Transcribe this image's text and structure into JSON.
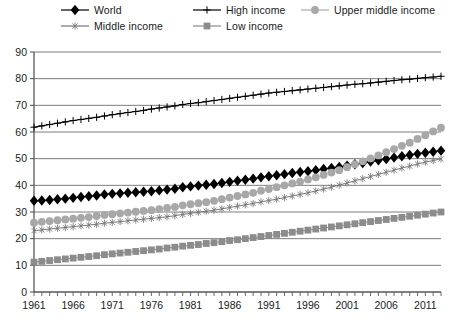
{
  "legend": {
    "items": [
      {
        "label": "World",
        "marker": "diamond-marker",
        "color": "#000000",
        "row": 0,
        "col": 0
      },
      {
        "label": "High income",
        "marker": "plus-marker",
        "color": "#000000",
        "row": 0,
        "col": 1
      },
      {
        "label": "Upper middle income",
        "marker": "circle-marker",
        "color": "#a8a8a8",
        "row": 0,
        "col": 2
      },
      {
        "label": "Middle income",
        "marker": "asterisk-marker",
        "color": "#767676",
        "row": 1,
        "col": 0
      },
      {
        "label": "Low income",
        "marker": "square-marker",
        "color": "#8c8c8c",
        "row": 1,
        "col": 1
      }
    ]
  },
  "chart_data": {
    "type": "line",
    "title": "",
    "xlabel": "",
    "ylabel": "",
    "xlim": [
      1961,
      2013
    ],
    "ylim": [
      0,
      90
    ],
    "ytick_step": 10,
    "yticks": [
      0,
      10,
      20,
      30,
      40,
      50,
      60,
      70,
      80,
      90
    ],
    "xticks": [
      1961,
      1966,
      1971,
      1976,
      1981,
      1986,
      1991,
      1996,
      2001,
      2006,
      2011
    ],
    "xtick_labels": [
      "1961",
      "1966",
      "1971",
      "1976",
      "1981",
      "1986",
      "1991",
      "1996",
      "2001",
      "2006",
      "2011"
    ],
    "minor_xticks_every": 1,
    "grid": "horizontal",
    "legend_position": "top",
    "x": [
      1961,
      1962,
      1963,
      1964,
      1965,
      1966,
      1967,
      1968,
      1969,
      1970,
      1971,
      1972,
      1973,
      1974,
      1975,
      1976,
      1977,
      1978,
      1979,
      1980,
      1981,
      1982,
      1983,
      1984,
      1985,
      1986,
      1987,
      1988,
      1989,
      1990,
      1991,
      1992,
      1993,
      1994,
      1995,
      1996,
      1997,
      1998,
      1999,
      2000,
      2001,
      2002,
      2003,
      2004,
      2005,
      2006,
      2007,
      2008,
      2009,
      2010,
      2011,
      2012,
      2013
    ],
    "series": [
      {
        "name": "World",
        "marker": "diamond-marker",
        "color": "#000000",
        "values": [
          34.2,
          34.3,
          34.5,
          34.8,
          35.0,
          35.3,
          35.6,
          35.9,
          36.2,
          36.6,
          36.8,
          37.0,
          37.2,
          37.4,
          37.6,
          37.8,
          38.1,
          38.4,
          38.7,
          39.3,
          39.6,
          39.9,
          40.2,
          40.5,
          40.9,
          41.3,
          41.7,
          42.1,
          42.5,
          43.0,
          43.4,
          43.8,
          44.2,
          44.6,
          45.0,
          45.3,
          45.7,
          46.1,
          46.5,
          46.9,
          47.4,
          47.9,
          48.4,
          48.9,
          49.4,
          49.9,
          50.4,
          50.9,
          51.4,
          51.8,
          52.2,
          52.6,
          53.0
        ]
      },
      {
        "name": "High income",
        "marker": "plus-marker",
        "color": "#000000",
        "values": [
          61.8,
          62.3,
          62.8,
          63.3,
          63.8,
          64.3,
          64.7,
          65.1,
          65.5,
          66.0,
          66.5,
          66.9,
          67.3,
          67.7,
          68.1,
          68.6,
          69.0,
          69.4,
          69.8,
          70.3,
          70.7,
          71.0,
          71.4,
          71.8,
          72.2,
          72.6,
          73.0,
          73.4,
          73.8,
          74.2,
          74.6,
          74.9,
          75.2,
          75.5,
          75.8,
          76.1,
          76.4,
          76.7,
          77.0,
          77.3,
          77.6,
          77.9,
          78.1,
          78.4,
          78.7,
          79.0,
          79.3,
          79.6,
          79.8,
          80.1,
          80.4,
          80.6,
          80.9
        ]
      },
      {
        "name": "Upper middle income",
        "marker": "circle-marker",
        "color": "#a8a8a8",
        "values": [
          26.0,
          26.3,
          26.6,
          26.9,
          27.2,
          27.5,
          27.8,
          28.1,
          28.5,
          28.9,
          29.2,
          29.5,
          29.8,
          30.1,
          30.4,
          30.7,
          31.1,
          31.5,
          31.9,
          32.5,
          32.9,
          33.3,
          33.7,
          34.2,
          34.8,
          35.4,
          36.0,
          36.6,
          37.2,
          38.0,
          38.6,
          39.3,
          40.0,
          40.7,
          41.4,
          42.2,
          43.0,
          43.9,
          44.8,
          45.7,
          46.8,
          47.9,
          49.0,
          50.1,
          51.2,
          52.4,
          53.6,
          54.8,
          56.0,
          57.4,
          58.8,
          60.2,
          61.6
        ]
      },
      {
        "name": "Middle income",
        "marker": "asterisk-marker",
        "color": "#767676",
        "values": [
          23.0,
          23.3,
          23.6,
          23.9,
          24.2,
          24.5,
          24.8,
          25.1,
          25.4,
          25.8,
          26.1,
          26.4,
          26.7,
          27.0,
          27.3,
          27.6,
          27.9,
          28.2,
          28.6,
          29.1,
          29.5,
          29.9,
          30.3,
          30.7,
          31.2,
          31.7,
          32.2,
          32.7,
          33.2,
          33.8,
          34.3,
          34.8,
          35.4,
          36.0,
          36.6,
          37.2,
          37.9,
          38.6,
          39.3,
          40.1,
          40.9,
          41.7,
          42.5,
          43.3,
          44.1,
          44.9,
          45.7,
          46.5,
          47.2,
          48.0,
          48.7,
          49.3,
          49.9
        ]
      },
      {
        "name": "Low income",
        "marker": "square-marker",
        "color": "#8c8c8c",
        "values": [
          11.2,
          11.5,
          11.8,
          12.1,
          12.4,
          12.7,
          13.0,
          13.3,
          13.6,
          14.0,
          14.3,
          14.6,
          14.9,
          15.2,
          15.5,
          15.8,
          16.1,
          16.5,
          16.8,
          17.2,
          17.5,
          17.8,
          18.2,
          18.5,
          18.9,
          19.3,
          19.6,
          20.0,
          20.4,
          20.8,
          21.2,
          21.6,
          22.0,
          22.4,
          22.8,
          23.2,
          23.6,
          24.0,
          24.4,
          24.8,
          25.2,
          25.6,
          26.0,
          26.4,
          26.8,
          27.2,
          27.6,
          28.0,
          28.4,
          28.8,
          29.2,
          29.6,
          30.0
        ]
      }
    ]
  }
}
